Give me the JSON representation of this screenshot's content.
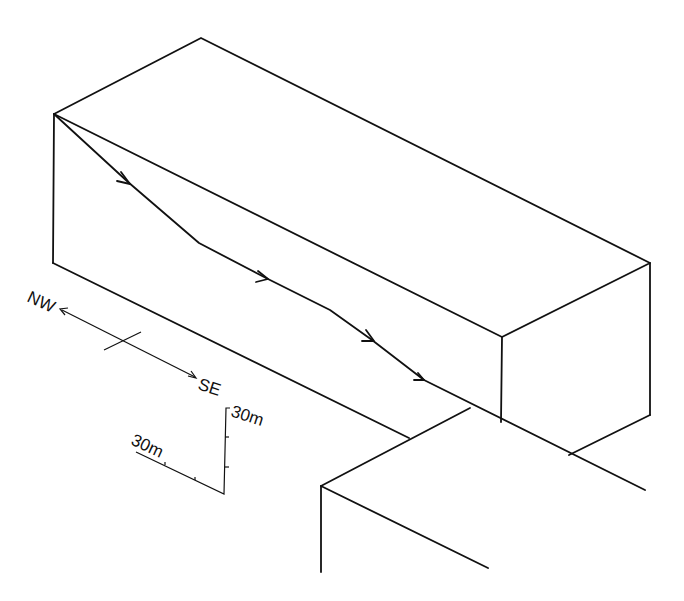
{
  "diagram": {
    "type": "isometric block diagram",
    "orientation": {
      "left_label": "NW",
      "right_label": "SE"
    },
    "scale": {
      "horizontal_label": "30m",
      "vertical_label": "30m"
    },
    "colors": {
      "line": "#111111",
      "background": "#ffffff"
    }
  }
}
